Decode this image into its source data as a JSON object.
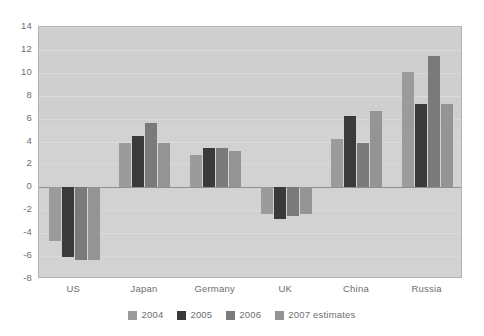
{
  "chart_data": {
    "type": "bar",
    "title": "",
    "subtitle": "",
    "xlabel": "",
    "ylabel": "",
    "ylim": [
      -8,
      14
    ],
    "ytick_step": 2,
    "yticks": [
      14,
      12,
      10,
      8,
      6,
      4,
      2,
      0,
      -2,
      -4,
      -6,
      -8
    ],
    "ytick_labels": [
      "14",
      "12",
      "10",
      "8",
      "6",
      "4",
      "2",
      "0",
      "-2",
      "-4",
      "-6",
      "-8"
    ],
    "grid": true,
    "legend_position": "bottom",
    "categories": [
      "US",
      "Japan",
      "Germany",
      "UK",
      "China",
      "Russia"
    ],
    "series": [
      {
        "name": "2004",
        "color": "#9b9b9b",
        "values": [
          -4.7,
          3.9,
          2.8,
          -2.3,
          4.2,
          10.1
        ]
      },
      {
        "name": "2005",
        "color": "#3a3a3a",
        "values": [
          -6.1,
          4.5,
          3.4,
          -2.8,
          6.2,
          7.3
        ]
      },
      {
        "name": "2006",
        "color": "#7a7a7a",
        "values": [
          -6.3,
          5.6,
          3.4,
          -2.5,
          3.9,
          11.5
        ]
      },
      {
        "name": "2007 estimates",
        "color": "#949494",
        "values": [
          -6.3,
          3.9,
          3.2,
          -2.3,
          6.7,
          7.3
        ]
      }
    ]
  },
  "legend": {
    "items": [
      {
        "label": "2004",
        "color": "#9b9b9b"
      },
      {
        "label": "2005",
        "color": "#3a3a3a"
      },
      {
        "label": "2006",
        "color": "#7a7a7a"
      },
      {
        "label": "2007 estimates",
        "color": "#949494"
      }
    ]
  },
  "style": {
    "plot_background": "#cfcfcf",
    "plot_band": "#d2d2d2",
    "gridline_color": "#dcdcdc",
    "zero_line_color": "#8f8f8f",
    "axis_text_color": "#6e6e6e",
    "page_background": "#ffffff"
  }
}
